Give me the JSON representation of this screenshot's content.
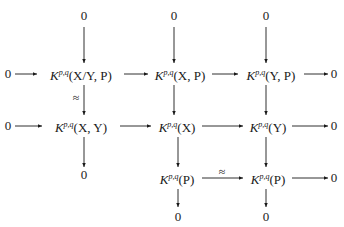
{
  "diagram": {
    "type": "commutative-diagram",
    "nodes": {
      "top1": "0",
      "top2": "0",
      "top3": "0",
      "r2_left": "0",
      "r2_a": {
        "base": "K",
        "sup": "p,q",
        "arg": "(X/Y, P)"
      },
      "r2_b": {
        "base": "K",
        "sup": "p,q",
        "arg": "(X, P)"
      },
      "r2_c": {
        "base": "K",
        "sup": "p,q",
        "arg": "(Y, P)"
      },
      "r2_right": "0",
      "r3_left": "0",
      "r3_a": {
        "base": "K",
        "sup": "p,q",
        "arg": "(X, Y)"
      },
      "r3_b": {
        "base": "K",
        "sup": "p,q",
        "arg": "(X)"
      },
      "r3_c": {
        "base": "K",
        "sup": "p,q",
        "arg": "(Y)"
      },
      "r3_right": "0",
      "r4_a": "0",
      "r4_b": {
        "base": "K",
        "sup": "p,q",
        "arg": "(P)"
      },
      "r4_c": {
        "base": "K",
        "sup": "p,q",
        "arg": "(P)"
      },
      "r4_right": "0",
      "bot2": "0",
      "bot3": "0"
    },
    "labels": {
      "iso_vertical": "≈",
      "iso_horizontal": "≈"
    }
  }
}
